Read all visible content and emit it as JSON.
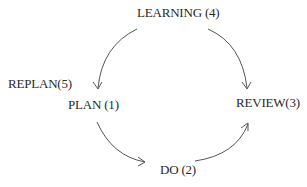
{
  "diagram": {
    "type": "cycle",
    "nodes": [
      {
        "id": "plan",
        "label": "PLAN (1)"
      },
      {
        "id": "do",
        "label": "DO (2)"
      },
      {
        "id": "review",
        "label": "REVIEW(3)"
      },
      {
        "id": "learning",
        "label": "LEARNING (4)"
      },
      {
        "id": "replan",
        "label": "REPLAN(5)"
      }
    ],
    "edges": [
      {
        "from": "plan",
        "to": "do"
      },
      {
        "from": "do",
        "to": "review"
      },
      {
        "from": "learning",
        "to": "review"
      },
      {
        "from": "learning",
        "to": "plan"
      }
    ],
    "line_color": "#555555",
    "text_color": "#2a2a2a"
  }
}
